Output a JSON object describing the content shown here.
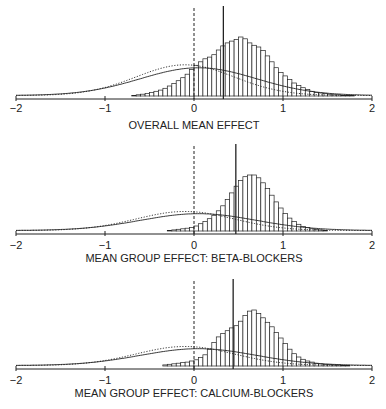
{
  "colors": {
    "ink": "#222222",
    "bar_fill": "#ffffff",
    "background": "#ffffff"
  },
  "axis": {
    "ticks": [
      -2,
      -1,
      0,
      1,
      2
    ],
    "tick_labels": [
      "−2",
      "−1",
      "0",
      "1",
      "2"
    ],
    "xlim": [
      -2,
      2
    ]
  },
  "chart_data": [
    {
      "type": "bar",
      "title": "OVERALL MEAN EFFECT",
      "xlabel": "OVERALL MEAN EFFECT",
      "ylabel": "",
      "xlim": [
        -2,
        2
      ],
      "grid": false,
      "legend": null,
      "reference_line_dashed": 0,
      "posterior_mean_line": 0.33,
      "histogram": {
        "bin_width": 0.05,
        "start": -0.7,
        "heights": [
          0.01,
          0.02,
          0.03,
          0.04,
          0.06,
          0.08,
          0.1,
          0.13,
          0.17,
          0.21,
          0.26,
          0.31,
          0.37,
          0.45,
          0.52,
          0.58,
          0.63,
          0.66,
          0.7,
          0.78,
          0.85,
          0.9,
          0.93,
          0.96,
          1.0,
          0.97,
          0.9,
          0.86,
          0.83,
          0.77,
          0.68,
          0.58,
          0.48,
          0.4,
          0.34,
          0.28,
          0.22,
          0.18,
          0.14,
          0.11,
          0.08,
          0.06,
          0.05,
          0.04,
          0.03,
          0.02,
          0.02,
          0.01,
          0.01,
          0.01
        ]
      },
      "prior_curve": {
        "style": "dotted",
        "mean": -0.1,
        "sd": 0.55,
        "peak": 0.52
      },
      "likelihood_curve": {
        "style": "solid",
        "mean": 0.05,
        "sd": 0.65,
        "peak": 0.47
      }
    },
    {
      "type": "bar",
      "title": "MEAN GROUP EFFECT: BETA-BLOCKERS",
      "xlabel": "MEAN GROUP EFFECT: BETA-BLOCKERS",
      "ylabel": "",
      "xlim": [
        -2,
        2
      ],
      "grid": false,
      "legend": null,
      "reference_line_dashed": 0,
      "posterior_mean_line": 0.47,
      "histogram": {
        "bin_width": 0.05,
        "start": -0.3,
        "heights": [
          0.01,
          0.02,
          0.03,
          0.04,
          0.05,
          0.06,
          0.09,
          0.13,
          0.17,
          0.22,
          0.28,
          0.36,
          0.45,
          0.56,
          0.68,
          0.8,
          0.9,
          0.97,
          1.0,
          1.0,
          0.95,
          0.86,
          0.76,
          0.64,
          0.52,
          0.41,
          0.31,
          0.23,
          0.17,
          0.12,
          0.08,
          0.06,
          0.04,
          0.03,
          0.02,
          0.01
        ]
      },
      "prior_curve": {
        "style": "dotted",
        "mean": -0.1,
        "sd": 0.55,
        "peak": 0.34
      },
      "likelihood_curve": {
        "style": "solid",
        "mean": 0.05,
        "sd": 0.65,
        "peak": 0.3
      }
    },
    {
      "type": "bar",
      "title": "MEAN GROUP EFFECT: CALCIUM-BLOCKERS",
      "xlabel": "MEAN GROUP EFFECT: CALCIUM-BLOCKERS",
      "ylabel": "",
      "xlim": [
        -2,
        2
      ],
      "grid": false,
      "legend": null,
      "reference_line_dashed": 0,
      "posterior_mean_line": 0.44,
      "histogram": {
        "bin_width": 0.05,
        "start": -0.35,
        "heights": [
          0.02,
          0.03,
          0.04,
          0.05,
          0.06,
          0.07,
          0.09,
          0.11,
          0.15,
          0.2,
          0.3,
          0.42,
          0.52,
          0.58,
          0.63,
          0.68,
          0.72,
          0.8,
          0.9,
          0.98,
          1.0,
          0.94,
          0.86,
          0.78,
          0.7,
          0.6,
          0.5,
          0.4,
          0.3,
          0.22,
          0.16,
          0.12,
          0.09,
          0.07,
          0.05,
          0.04,
          0.03,
          0.03,
          0.02,
          0.02,
          0.01,
          0.01
        ]
      },
      "prior_curve": {
        "style": "dotted",
        "mean": -0.1,
        "sd": 0.55,
        "peak": 0.34
      },
      "likelihood_curve": {
        "style": "solid",
        "mean": 0.05,
        "sd": 0.65,
        "peak": 0.3
      }
    }
  ]
}
